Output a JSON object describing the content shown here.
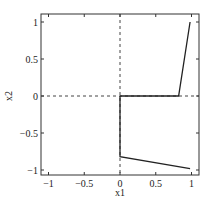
{
  "chart_data": {
    "type": "line",
    "title": "",
    "xlabel": "x1",
    "ylabel": "x2",
    "xlim": [
      -1.1,
      1.1
    ],
    "ylim": [
      -1.1,
      1.1
    ],
    "xticks": [
      "-1",
      "-0.5",
      "0",
      "0.5",
      "1"
    ],
    "yticks": [
      "1",
      "0.5",
      "0",
      "-0.5",
      "-1"
    ],
    "grid": false,
    "reference_lines": [
      {
        "orientation": "vertical",
        "x": 0,
        "style": "dashed"
      },
      {
        "orientation": "horizontal",
        "y": 0,
        "style": "dashed"
      }
    ],
    "series": [
      {
        "name": "upper",
        "x": [
          0,
          0.82,
          0.98
        ],
        "y": [
          0,
          0,
          1
        ]
      },
      {
        "name": "lower",
        "x": [
          0,
          0,
          0.98
        ],
        "y": [
          0,
          -0.82,
          -0.98
        ]
      }
    ]
  }
}
